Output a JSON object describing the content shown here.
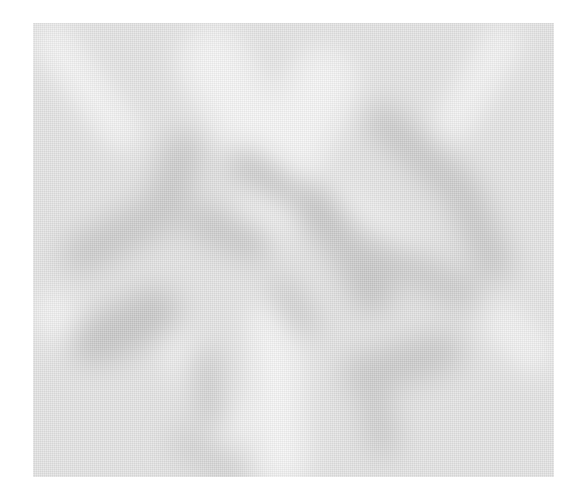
{
  "image": {
    "description": "Blurred grayscale abstract pattern with dark diagonal bands forming an X/V shape on a light gray field",
    "colors": {
      "page_background": "#ffffff",
      "field": "#e4e4e4",
      "light_band": "#f6f6f6",
      "dark_band": "#c4c4c4"
    }
  }
}
